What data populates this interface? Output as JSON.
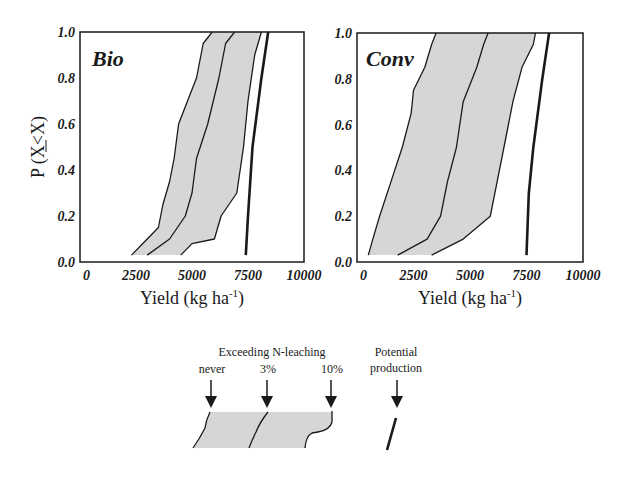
{
  "chart_data": [
    {
      "type": "area",
      "title": "Bio",
      "xlabel": "Yield (kg ha-1)",
      "ylabel": "P (X<X)",
      "xlim": [
        0,
        10000
      ],
      "ylim": [
        0.0,
        1.0
      ],
      "xticks": [
        "0",
        "2500",
        "5000",
        "7500",
        "10000"
      ],
      "yticks": [
        "0.0",
        "0.2",
        "0.4",
        "0.6",
        "0.8",
        "1.0"
      ],
      "grid": false,
      "series": [
        {
          "name": "Exceeding N-leaching never",
          "style": "line",
          "p": [
            0.03,
            0.1,
            0.15,
            0.25,
            0.35,
            0.45,
            0.6,
            0.7,
            0.8,
            0.95,
            1.0
          ],
          "yield": [
            2300,
            3000,
            3500,
            3700,
            4000,
            4200,
            4400,
            4800,
            5200,
            5500,
            5900
          ]
        },
        {
          "name": "Exceeding N-leaching 3%",
          "style": "line",
          "p": [
            0.03,
            0.1,
            0.2,
            0.3,
            0.45,
            0.6,
            0.8,
            0.95,
            1.0
          ],
          "yield": [
            3000,
            4000,
            4700,
            5000,
            5200,
            5700,
            6200,
            6500,
            6900
          ]
        },
        {
          "name": "Exceeding N-leaching 10%",
          "style": "line",
          "p": [
            0.03,
            0.08,
            0.1,
            0.2,
            0.3,
            0.5,
            0.7,
            0.9,
            1.0
          ],
          "yield": [
            4500,
            5000,
            6000,
            6300,
            7000,
            7300,
            7500,
            7800,
            8100
          ]
        },
        {
          "name": "Potential production",
          "style": "bold-line",
          "p": [
            0.03,
            0.2,
            0.5,
            0.8,
            1.0
          ],
          "yield": [
            7400,
            7500,
            7700,
            8100,
            8400
          ]
        }
      ],
      "shaded_band": {
        "between": [
          "Exceeding N-leaching never",
          "Exceeding N-leaching 10%"
        ],
        "color": "#d9d9d9"
      }
    },
    {
      "type": "area",
      "title": "Conv",
      "xlabel": "Yield (kg ha-1)",
      "ylabel": "",
      "xlim": [
        0,
        10000
      ],
      "ylim": [
        0.0,
        1.0
      ],
      "xticks": [
        "0",
        "2500",
        "5000",
        "7500",
        "10000"
      ],
      "yticks": [
        "0.0",
        "0.2",
        "0.4",
        "0.6",
        "0.8",
        "1.0"
      ],
      "grid": false,
      "series": [
        {
          "name": "Exceeding N-leaching never",
          "style": "line",
          "p": [
            0.03,
            0.1,
            0.2,
            0.35,
            0.5,
            0.65,
            0.75,
            0.85,
            0.95,
            1.0
          ],
          "yield": [
            500,
            700,
            1000,
            1500,
            2000,
            2400,
            2500,
            3000,
            3300,
            3500
          ]
        },
        {
          "name": "Exceeding N-leaching 3%",
          "style": "line",
          "p": [
            0.03,
            0.1,
            0.2,
            0.35,
            0.5,
            0.7,
            0.85,
            0.95,
            1.0
          ],
          "yield": [
            1800,
            3100,
            3700,
            4000,
            4400,
            4700,
            5300,
            5600,
            5800
          ]
        },
        {
          "name": "Exceeding N-leaching 10%",
          "style": "line",
          "p": [
            0.03,
            0.1,
            0.2,
            0.35,
            0.55,
            0.7,
            0.85,
            0.95,
            1.0
          ],
          "yield": [
            3300,
            4700,
            5900,
            6200,
            6600,
            6900,
            7300,
            7800,
            7900
          ]
        },
        {
          "name": "Potential production",
          "style": "bold-line",
          "p": [
            0.03,
            0.3,
            0.5,
            0.8,
            1.0
          ],
          "yield": [
            7500,
            7600,
            7800,
            8200,
            8500
          ]
        }
      ],
      "shaded_band": {
        "between": [
          "Exceeding N-leaching never",
          "Exceeding N-leaching 10%"
        ],
        "color": "#d9d9d9"
      }
    }
  ],
  "panels": {
    "bio": {
      "label": "Bio"
    },
    "conv": {
      "label": "Conv"
    }
  },
  "axes": {
    "ylabel": "P (X<X)",
    "xlabel_main": "Yield (kg ha",
    "xlabel_sup": "-1",
    "xlabel_close": ")",
    "xticks": [
      "0",
      "2500",
      "5000",
      "7500",
      "10000"
    ],
    "yticks": [
      "0.0",
      "0.2",
      "0.4",
      "0.6",
      "0.8",
      "1.0"
    ]
  },
  "legend": {
    "group_title": "Exceeding N-leaching",
    "never": "never",
    "three": "3%",
    "ten": "10%",
    "potential_line1": "Potential",
    "potential_line2": "production"
  },
  "colors": {
    "band": "#d6d6d6",
    "line": "#1a1a1a",
    "frame": "#1a1a1a"
  }
}
